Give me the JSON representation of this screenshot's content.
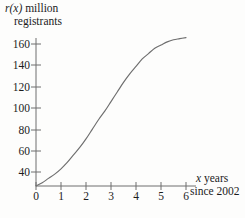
{
  "chart_data": {
    "type": "line",
    "title": "",
    "subtitle": "",
    "xlabel_line1": "x years",
    "xlabel_line2": "since 2002",
    "ylabel_line1": "r(x) million",
    "ylabel_line2": "registrants",
    "ylabel_function_symbol": "r(x)",
    "ylabel_units": "million registrants",
    "xlabel_variable": "x",
    "xlabel_text": "years since 2002",
    "xlim": [
      0,
      6.3
    ],
    "ylim": [
      27,
      172
    ],
    "xticks": [
      0,
      1,
      2,
      3,
      4,
      5,
      6
    ],
    "xtick_labels": [
      "0",
      "1",
      "2",
      "3",
      "4",
      "5",
      "6"
    ],
    "yticks": [
      40,
      60,
      80,
      100,
      120,
      140,
      160
    ],
    "ytick_labels": [
      "40",
      "60",
      "80",
      "100",
      "120",
      "140",
      "160"
    ],
    "grid": false,
    "legend": null,
    "curve_color": "#6e6e6e",
    "axis_color": "#6e6e6e",
    "text_color": "#1c1c1c",
    "background_color": "#fdfdfc",
    "series": [
      {
        "name": "r(x)",
        "shape": "logistic S-curve",
        "x": [
          0,
          0.25,
          0.5,
          0.75,
          1.0,
          1.25,
          1.5,
          1.75,
          2.0,
          2.25,
          2.5,
          2.75,
          3.0,
          3.25,
          3.5,
          3.75,
          4.0,
          4.25,
          4.5,
          4.75,
          5.0,
          5.25,
          5.5,
          5.75,
          6.0
        ],
        "values": [
          27,
          30,
          34,
          38,
          43,
          49,
          56,
          63,
          71,
          80,
          89,
          97,
          106,
          115,
          124,
          132,
          139,
          146,
          151,
          156,
          159,
          162,
          164,
          165,
          166
        ]
      }
    ],
    "bottom_artifact_text": "scanned page text fragment"
  }
}
